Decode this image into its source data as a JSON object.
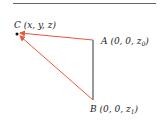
{
  "diagram": {
    "points": {
      "C": {
        "label": "C",
        "coords": "(x, y, z)"
      },
      "A": {
        "label": "A",
        "coords_prefix": "(0, 0, z",
        "sub": "0",
        "coords_suffix": ")"
      },
      "B": {
        "label": "B",
        "coords_prefix": "(0, 0, z",
        "sub": "1",
        "coords_suffix": ")"
      }
    },
    "edges": [
      {
        "from": "A",
        "to": "B",
        "style": "line",
        "color": "#333333"
      },
      {
        "from": "A",
        "to": "C",
        "style": "arrow",
        "color": "#e8593c"
      },
      {
        "from": "B",
        "to": "C",
        "style": "arrow",
        "color": "#e8593c"
      }
    ]
  }
}
